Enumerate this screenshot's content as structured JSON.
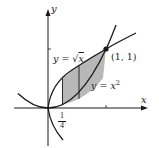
{
  "diagram": {
    "type": "function-graph",
    "axes": {
      "x_label": "x",
      "y_label": "y"
    },
    "curves": [
      {
        "name": "sqrt",
        "label_lhs": "y = ",
        "label_rhs": "√x",
        "label_var": "x"
      },
      {
        "name": "square",
        "label_lhs": "y = ",
        "label_var": "x",
        "label_exp": "2"
      }
    ],
    "intersection_point": {
      "label": "(1, 1)",
      "x": 1,
      "y": 1
    },
    "shaded_region": {
      "from_x": 0.25,
      "to_x": 1,
      "divider_x": 0.5,
      "fill": "#b8b8b8"
    },
    "tick_label_x": {
      "numerator": "1",
      "denominator": "4"
    },
    "colors": {
      "line": "#1a1a1a",
      "shade": "#b8b8b8",
      "background": "#ffffff"
    }
  }
}
